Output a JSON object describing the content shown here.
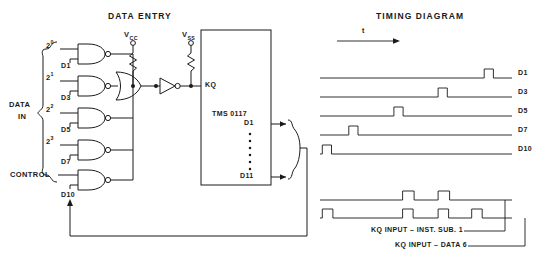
{
  "figure": {
    "left_title": "DATA ENTRY",
    "right_title": "TIMING DIAGRAM"
  },
  "circuit": {
    "group_label_line1": "DATA",
    "group_label_line2": "IN",
    "control_label": "CONTROL",
    "feedback_label": "D10",
    "chip_name": "TMS 0117",
    "chip_input_pin": "KQ",
    "chip_output_first": "D1",
    "chip_output_last": "D11",
    "supplies": [
      {
        "name": "V",
        "subscript": "CC"
      },
      {
        "name": "V",
        "subscript": "SS"
      }
    ],
    "gates": [
      {
        "weight_base": "2",
        "weight_exp": "0",
        "data_label": "D1"
      },
      {
        "weight_base": "2",
        "weight_exp": "1",
        "data_label": "D3"
      },
      {
        "weight_base": "2",
        "weight_exp": "2",
        "data_label": "D5"
      },
      {
        "weight_base": "2",
        "weight_exp": "3",
        "data_label": "D7"
      },
      {
        "weight_base": "",
        "weight_exp": "",
        "data_label": "D10"
      }
    ]
  },
  "timing": {
    "axis_label": "t",
    "traces": [
      {
        "name": "D1",
        "pulses": [
          {
            "start": 0.855,
            "width": 0.048
          }
        ]
      },
      {
        "name": "D3",
        "pulses": [
          {
            "start": 0.615,
            "width": 0.048
          }
        ]
      },
      {
        "name": "D5",
        "pulses": [
          {
            "start": 0.385,
            "width": 0.048
          }
        ]
      },
      {
        "name": "D7",
        "pulses": [
          {
            "start": 0.15,
            "width": 0.048
          }
        ]
      },
      {
        "name": "D10",
        "pulses": [
          {
            "start": 0.012,
            "width": 0.048
          }
        ]
      }
    ],
    "kq_traces": [
      {
        "caption": "KQ INPUT – INST. SUB. 1",
        "pulses": [
          {
            "start": 0.43,
            "width": 0.06
          },
          {
            "start": 0.615,
            "width": 0.06
          }
        ]
      },
      {
        "caption": "KQ INPUT – DATA 6",
        "pulses": [
          {
            "start": 0.012,
            "width": 0.055
          },
          {
            "start": 0.43,
            "width": 0.055
          },
          {
            "start": 0.615,
            "width": 0.055
          },
          {
            "start": 0.79,
            "width": 0.055
          }
        ]
      }
    ]
  }
}
